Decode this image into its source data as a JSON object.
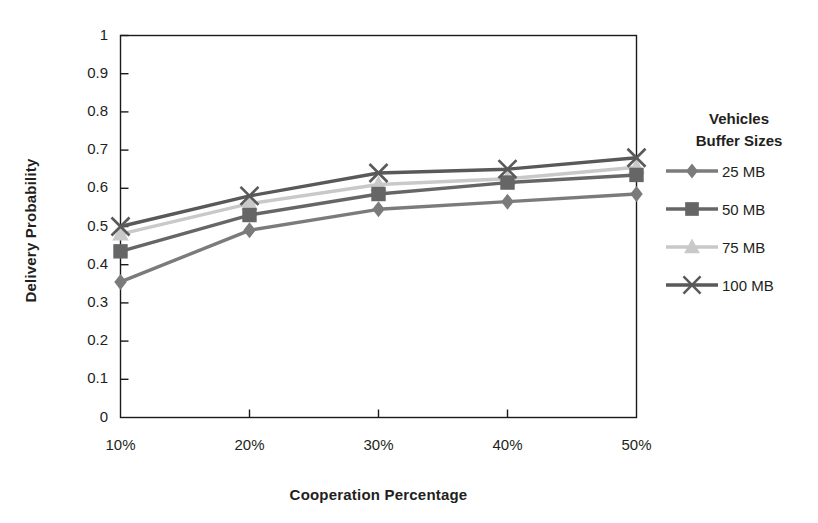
{
  "chart_data": {
    "type": "line",
    "title": "",
    "xlabel": "Cooperation Percentage",
    "ylabel": "Delivery Probability",
    "categories": [
      "10%",
      "20%",
      "30%",
      "40%",
      "50%"
    ],
    "x_tick_labels": [
      "10%",
      "20%",
      "30%",
      "40%",
      "50%"
    ],
    "y_tick_labels": [
      "0",
      "0.1",
      "0.2",
      "0.3",
      "0.4",
      "0.5",
      "0.6",
      "0.7",
      "0.8",
      "0.9",
      "1"
    ],
    "ylim": [
      0,
      1
    ],
    "y_tick_step": 0.1,
    "grid": false,
    "legend_position": "right",
    "legend_title_lines": [
      "Vehicles",
      "Buffer Sizes"
    ],
    "series": [
      {
        "name": "25 MB",
        "marker": "diamond",
        "color": "#7b7b7b",
        "values": [
          0.355,
          0.49,
          0.545,
          0.565,
          0.585
        ]
      },
      {
        "name": "50 MB",
        "marker": "square",
        "color": "#666666",
        "values": [
          0.435,
          0.53,
          0.585,
          0.615,
          0.635
        ]
      },
      {
        "name": "75 MB",
        "marker": "triangle",
        "color": "#c9c9c9",
        "values": [
          0.48,
          0.56,
          0.61,
          0.625,
          0.655
        ]
      },
      {
        "name": "100 MB",
        "marker": "cross",
        "color": "#595959",
        "values": [
          0.5,
          0.58,
          0.64,
          0.65,
          0.68
        ]
      }
    ]
  },
  "legend": {
    "title_line_1": "Vehicles",
    "title_line_2": "Buffer Sizes",
    "items": [
      {
        "label": "25 MB"
      },
      {
        "label": "50 MB"
      },
      {
        "label": "75 MB"
      },
      {
        "label": "100 MB"
      }
    ]
  },
  "axes": {
    "x_title": "Cooperation Percentage",
    "y_title": "Delivery Probability"
  },
  "colors": {
    "axis": "#231f20",
    "plot_border": "#1a1a1a",
    "background": "#ffffff"
  }
}
